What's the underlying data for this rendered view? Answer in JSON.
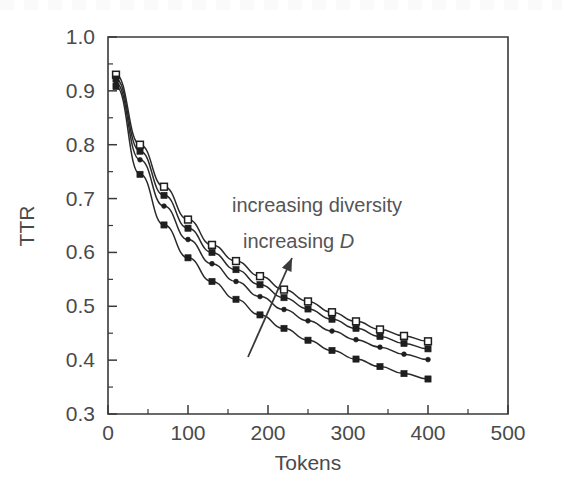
{
  "chart_data": {
    "type": "line",
    "title": "",
    "xlabel": "Tokens",
    "ylabel": "TTR",
    "xlim": [
      0,
      500
    ],
    "ylim": [
      0.3,
      1.0
    ],
    "xticks": [
      0,
      100,
      200,
      300,
      400,
      500
    ],
    "xtick_labels": [
      "0",
      "100",
      "200",
      "300",
      "400",
      "500"
    ],
    "xminor_step": 50,
    "yticks": [
      0.3,
      0.4,
      0.5,
      0.6,
      0.7,
      0.8,
      0.9,
      1.0
    ],
    "ytick_labels": [
      "0.3",
      "0.4",
      "0.5",
      "0.6",
      "0.7",
      "0.8",
      "0.9",
      "1.0"
    ],
    "yminor_step": 0.05,
    "grid": false,
    "legend": null,
    "x": [
      10,
      40,
      70,
      100,
      130,
      160,
      190,
      220,
      250,
      280,
      310,
      340,
      370,
      400
    ],
    "series": [
      {
        "name": "highest-D",
        "marker": "open-square",
        "values": [
          0.93,
          0.8,
          0.722,
          0.661,
          0.614,
          0.584,
          0.556,
          0.531,
          0.509,
          0.489,
          0.472,
          0.457,
          0.445,
          0.435
        ]
      },
      {
        "name": "high-D",
        "marker": "filled-square",
        "values": [
          0.922,
          0.788,
          0.706,
          0.645,
          0.6,
          0.568,
          0.54,
          0.516,
          0.495,
          0.476,
          0.459,
          0.444,
          0.431,
          0.421
        ]
      },
      {
        "name": "mid-D",
        "marker": "filled-dot",
        "values": [
          0.914,
          0.772,
          0.686,
          0.624,
          0.579,
          0.546,
          0.518,
          0.494,
          0.473,
          0.454,
          0.438,
          0.424,
          0.411,
          0.401
        ]
      },
      {
        "name": "low-D",
        "marker": "filled-square",
        "values": [
          0.908,
          0.745,
          0.651,
          0.59,
          0.546,
          0.513,
          0.484,
          0.459,
          0.437,
          0.418,
          0.402,
          0.388,
          0.375,
          0.365
        ]
      }
    ],
    "annotations": [
      {
        "text": "increasing diversity",
        "x_px": 232,
        "y_px": 212
      },
      {
        "text": "increasing ",
        "italic_tail": "D",
        "x_px": 243,
        "y_px": 248
      }
    ],
    "arrow": {
      "x1": 248,
      "y1": 357,
      "x2": 292,
      "y2": 258
    }
  },
  "axis": {
    "x_title": "Tokens",
    "y_title": "TTR"
  },
  "annotation_text": {
    "line1": "increasing diversity",
    "line2_prefix": "increasing ",
    "line2_symbol": "D"
  },
  "colors": {
    "ink": "#2a2a2a",
    "label": "#4a4a4a",
    "background": "#ffffff"
  }
}
